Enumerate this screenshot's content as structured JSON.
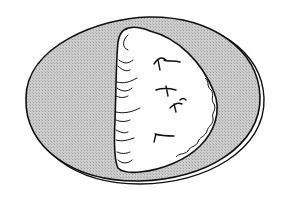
{
  "illustration": {
    "subject": "half-moon pastry on an oval plate",
    "style": "black ink line drawing",
    "colors": {
      "background": "#ffffff",
      "plate_fill": "#c8c8c8",
      "plate_hatch": "#a8a8a8",
      "pastry_fill": "#ffffff",
      "ink": "#111111"
    },
    "elements": [
      {
        "name": "plate",
        "shape": "oval"
      },
      {
        "name": "pastry",
        "shape": "half-moon"
      },
      {
        "name": "vent-slits",
        "count": 4
      }
    ]
  }
}
